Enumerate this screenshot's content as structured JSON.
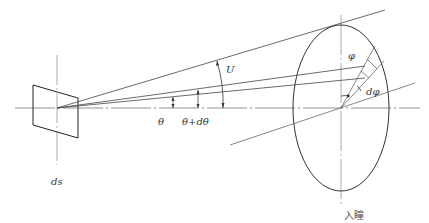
{
  "diagram": {
    "type": "optical-geometry",
    "labels": {
      "surface_element": "ds",
      "theta": "θ",
      "theta_dtheta": "θ+dθ",
      "aperture_angle": "U",
      "phi": "φ",
      "dphi": "dφ",
      "entrance_pupil": "入瞳"
    },
    "colors": {
      "line": "#333333",
      "axis": "#888888",
      "background": "#ffffff"
    }
  }
}
